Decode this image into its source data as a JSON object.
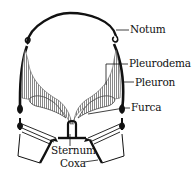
{
  "diagram": {
    "colors": {
      "ink": "#111111",
      "shading": "#9a9a9a",
      "background": "#ffffff"
    },
    "labels": [
      {
        "id": "notum",
        "text": "Notum",
        "x": 130,
        "y": 24
      },
      {
        "id": "pleurodema",
        "text": "Pleurodema",
        "x": 129,
        "y": 58
      },
      {
        "id": "pleuron",
        "text": "Pleuron",
        "x": 135,
        "y": 77
      },
      {
        "id": "furca",
        "text": "Furca",
        "x": 131,
        "y": 102
      },
      {
        "id": "sternum",
        "text": "Sternum",
        "x": 51,
        "y": 145
      },
      {
        "id": "coxa",
        "text": "Coxa",
        "x": 60,
        "y": 158
      }
    ]
  }
}
